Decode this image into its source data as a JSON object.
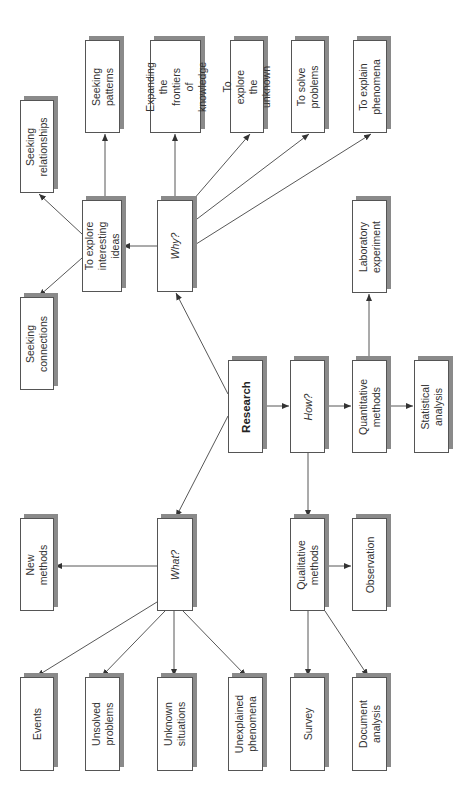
{
  "diagram": {
    "title": "Research",
    "colors": {
      "line": "#444444",
      "box_border": "#555555",
      "shadow": "#8a8a8a",
      "text": "#333333"
    },
    "nodes": [
      {
        "id": "research",
        "label": "Research",
        "style": "bold",
        "x": 228,
        "y": 360,
        "w": 35,
        "h": 93
      },
      {
        "id": "why",
        "label": "Why?",
        "style": "italic",
        "x": 157,
        "y": 200,
        "w": 36,
        "h": 92
      },
      {
        "id": "how",
        "label": "How?",
        "style": "italic",
        "x": 290,
        "y": 360,
        "w": 35,
        "h": 93
      },
      {
        "id": "what",
        "label": "What?",
        "style": "italic",
        "x": 157,
        "y": 518,
        "w": 36,
        "h": 93
      },
      {
        "id": "explore_ideas",
        "label": "To explore\ninteresting\nideas",
        "style": "normal",
        "x": 82,
        "y": 200,
        "w": 40,
        "h": 92
      },
      {
        "id": "seeking_relationships",
        "label": "Seeking\nrelationships",
        "style": "normal",
        "x": 20,
        "y": 100,
        "w": 34,
        "h": 93
      },
      {
        "id": "seeking_connections",
        "label": "Seeking\nconnections",
        "style": "normal",
        "x": 20,
        "y": 297,
        "w": 34,
        "h": 93
      },
      {
        "id": "seeking_patterns",
        "label": "Seeking\npatterns",
        "style": "normal",
        "x": 85,
        "y": 40,
        "w": 35,
        "h": 93
      },
      {
        "id": "expanding_frontiers",
        "label": "Expanding\nthe frontiers\nof knowledge",
        "style": "normal",
        "x": 150,
        "y": 40,
        "w": 51,
        "h": 93
      },
      {
        "id": "explore_unknown",
        "label": "To explore\nthe unknown",
        "style": "normal",
        "x": 230,
        "y": 40,
        "w": 34,
        "h": 93
      },
      {
        "id": "solve_problems",
        "label": "To solve\nproblems",
        "style": "normal",
        "x": 291,
        "y": 40,
        "w": 34,
        "h": 93
      },
      {
        "id": "explain_phenomena",
        "label": "To explain\nphenomena",
        "style": "normal",
        "x": 353,
        "y": 40,
        "w": 34,
        "h": 93
      },
      {
        "id": "lab_experiment",
        "label": "Laboratory\nexperiment",
        "style": "normal",
        "x": 352,
        "y": 200,
        "w": 35,
        "h": 93
      },
      {
        "id": "quantitative",
        "label": "Quantitative\nmethods",
        "style": "normal",
        "x": 352,
        "y": 360,
        "w": 35,
        "h": 93
      },
      {
        "id": "statistical",
        "label": "Statistical\nanalysis",
        "style": "normal",
        "x": 414,
        "y": 360,
        "w": 35,
        "h": 93
      },
      {
        "id": "new_methods",
        "label": "New methods",
        "style": "normal",
        "x": 20,
        "y": 518,
        "w": 34,
        "h": 93
      },
      {
        "id": "qualitative",
        "label": "Qualitative\nmethods",
        "style": "normal",
        "x": 290,
        "y": 518,
        "w": 35,
        "h": 93
      },
      {
        "id": "observation",
        "label": "Observation",
        "style": "normal",
        "x": 352,
        "y": 518,
        "w": 35,
        "h": 93
      },
      {
        "id": "events",
        "label": "Events",
        "style": "normal",
        "x": 20,
        "y": 677,
        "w": 34,
        "h": 94
      },
      {
        "id": "unsolved_problems",
        "label": "Unsolved\nproblems",
        "style": "normal",
        "x": 85,
        "y": 677,
        "w": 35,
        "h": 94
      },
      {
        "id": "unknown_situations",
        "label": "Unknown\nsituations",
        "style": "normal",
        "x": 157,
        "y": 677,
        "w": 36,
        "h": 94
      },
      {
        "id": "unexplained_phenomena",
        "label": "Unexplained\nphenomena",
        "style": "normal",
        "x": 228,
        "y": 677,
        "w": 35,
        "h": 94
      },
      {
        "id": "survey",
        "label": "Survey",
        "style": "normal",
        "x": 290,
        "y": 677,
        "w": 35,
        "h": 94
      },
      {
        "id": "document_analysis",
        "label": "Document\nanalysis",
        "style": "normal",
        "x": 352,
        "y": 677,
        "w": 35,
        "h": 94
      }
    ],
    "edges": [
      {
        "from": "research",
        "to": "why",
        "x1": 228,
        "y1": 394,
        "x2": 176,
        "y2": 293
      },
      {
        "from": "research",
        "to": "what",
        "x1": 228,
        "y1": 416,
        "x2": 176,
        "y2": 517
      },
      {
        "from": "research",
        "to": "how",
        "x1": 263,
        "y1": 406,
        "x2": 289,
        "y2": 406
      },
      {
        "from": "why",
        "to": "explore_ideas",
        "x1": 157,
        "y1": 246,
        "x2": 123,
        "y2": 246
      },
      {
        "from": "explore_ideas",
        "to": "seeking_relationships",
        "x1": 82,
        "y1": 234,
        "x2": 39,
        "y2": 194
      },
      {
        "from": "explore_ideas",
        "to": "seeking_connections",
        "x1": 82,
        "y1": 258,
        "x2": 39,
        "y2": 296
      },
      {
        "from": "explore_ideas",
        "to": "seeking_patterns",
        "x1": 105,
        "y1": 199,
        "x2": 105,
        "y2": 134
      },
      {
        "from": "why",
        "to": "expanding_frontiers",
        "x1": 175,
        "y1": 199,
        "x2": 175,
        "y2": 134
      },
      {
        "from": "why",
        "to": "explore_unknown",
        "x1": 193,
        "y1": 200,
        "x2": 250,
        "y2": 134
      },
      {
        "from": "why",
        "to": "solve_problems",
        "x1": 193,
        "y1": 222,
        "x2": 309,
        "y2": 134
      },
      {
        "from": "why",
        "to": "explain_phenomena",
        "x1": 193,
        "y1": 246,
        "x2": 371,
        "y2": 134
      },
      {
        "from": "how",
        "to": "quantitative",
        "x1": 325,
        "y1": 406,
        "x2": 351,
        "y2": 406
      },
      {
        "from": "quantitative",
        "to": "lab_experiment",
        "x1": 369,
        "y1": 360,
        "x2": 369,
        "y2": 294
      },
      {
        "from": "quantitative",
        "to": "statistical",
        "x1": 387,
        "y1": 406,
        "x2": 413,
        "y2": 406
      },
      {
        "from": "how",
        "to": "qualitative",
        "x1": 308,
        "y1": 453,
        "x2": 308,
        "y2": 517
      },
      {
        "from": "qualitative",
        "to": "observation",
        "x1": 325,
        "y1": 566,
        "x2": 351,
        "y2": 566
      },
      {
        "from": "qualitative",
        "to": "survey",
        "x1": 308,
        "y1": 611,
        "x2": 308,
        "y2": 676
      },
      {
        "from": "qualitative",
        "to": "document_analysis",
        "x1": 325,
        "y1": 611,
        "x2": 368,
        "y2": 676
      },
      {
        "from": "what",
        "to": "new_methods",
        "x1": 157,
        "y1": 566,
        "x2": 55,
        "y2": 566
      },
      {
        "from": "what",
        "to": "events",
        "x1": 157,
        "y1": 602,
        "x2": 37,
        "y2": 676
      },
      {
        "from": "what",
        "to": "unsolved_problems",
        "x1": 165,
        "y1": 611,
        "x2": 102,
        "y2": 676
      },
      {
        "from": "what",
        "to": "unknown_situations",
        "x1": 174,
        "y1": 611,
        "x2": 174,
        "y2": 676
      },
      {
        "from": "what",
        "to": "unexplained_phenomena",
        "x1": 183,
        "y1": 611,
        "x2": 246,
        "y2": 676
      }
    ]
  }
}
